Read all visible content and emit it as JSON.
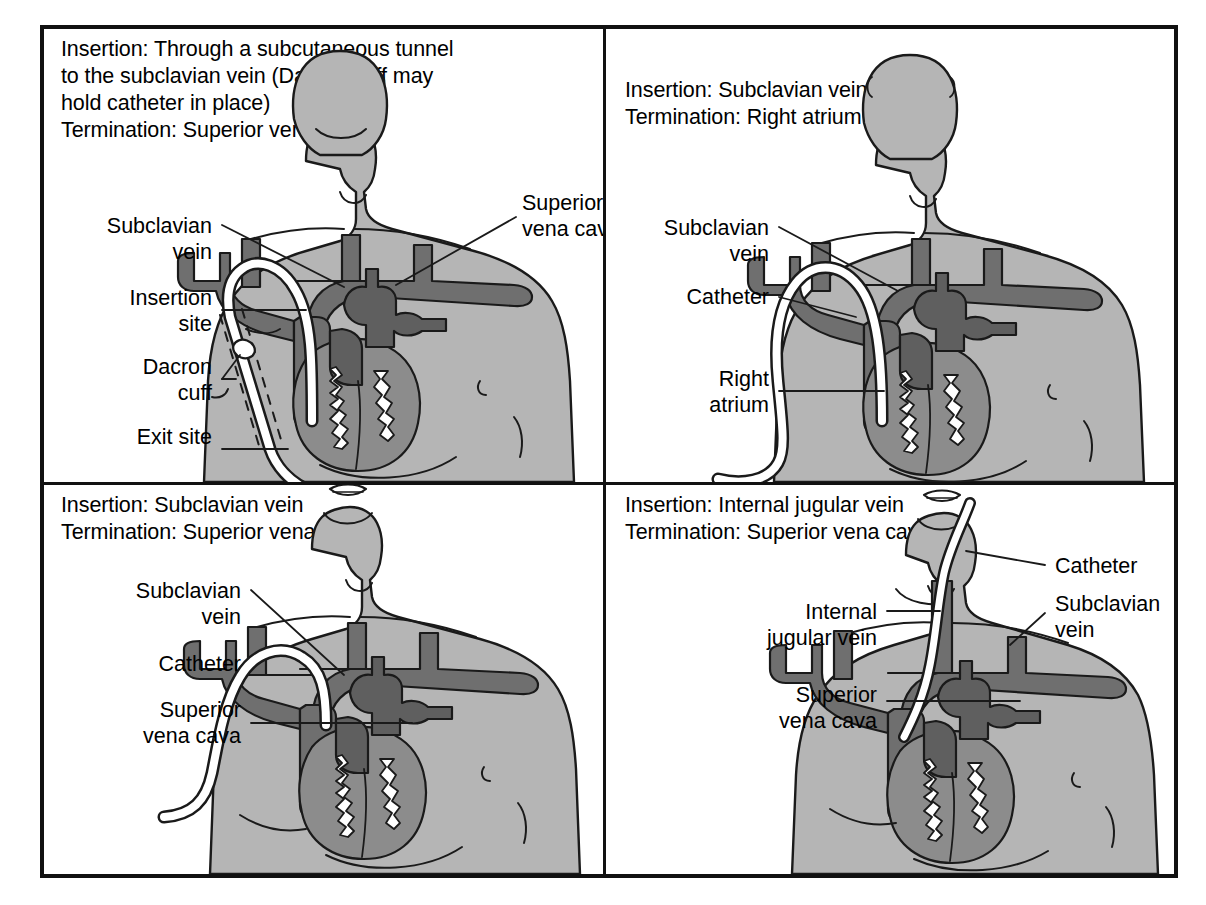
{
  "figure": {
    "colors": {
      "frame": "#111111",
      "skin": "#b5b5b5",
      "skin_shadow": "#a2a2a2",
      "vessel": "#6f6f6f",
      "heart": "#8c8c8c",
      "heart_dark": "#5f5f5f",
      "catheter_fill": "#ffffff",
      "outline": "#1a1a1a",
      "text": "#000000",
      "background": "#ffffff"
    },
    "panel_count": 4,
    "layout": "2x2 grid"
  },
  "panels": [
    {
      "id": "tunneled-subclavian-svc",
      "position": "top-left",
      "caption": "Insertion: Through a subcutaneous tunnel\nto the subclavian vein (Dacron cuff may\nhold catheter in place)\nTermination: Superior vena cava",
      "insertion": "Through a subcutaneous tunnel to the subclavian vein (Dacron cuff may hold catheter in place)",
      "termination": "Superior vena cava",
      "labels": [
        {
          "name": "subclavian-vein",
          "text": "Subclavian\nvein",
          "align": "right",
          "x": 168,
          "y": 196
        },
        {
          "name": "insertion-site",
          "text": "Insertion\nsite",
          "align": "right",
          "x": 168,
          "y": 268
        },
        {
          "name": "dacron-cuff",
          "text": "Dacron\ncuff",
          "align": "right",
          "x": 168,
          "y": 337
        },
        {
          "name": "exit-site",
          "text": "Exit site",
          "align": "right",
          "x": 168,
          "y": 407
        },
        {
          "name": "superior-vena-cava",
          "text": "Superior\nvena cava",
          "align": "left",
          "x": 478,
          "y": 173
        }
      ]
    },
    {
      "id": "subclavian-right-atrium",
      "position": "top-right",
      "caption": "Insertion: Subclavian vein\nTermination: Right atrium",
      "insertion": "Subclavian vein",
      "termination": "Right atrium",
      "labels": [
        {
          "name": "subclavian-vein",
          "text": "Subclavian\nvein",
          "align": "right",
          "x": 163,
          "y": 198
        },
        {
          "name": "catheter",
          "text": "Catheter",
          "align": "right",
          "x": 163,
          "y": 266
        },
        {
          "name": "right-atrium",
          "text": "Right\natrium",
          "align": "right",
          "x": 163,
          "y": 348
        }
      ]
    },
    {
      "id": "subclavian-svc",
      "position": "bottom-left",
      "caption": "Insertion: Subclavian vein\nTermination: Superior vena cava",
      "insertion": "Subclavian vein",
      "termination": "Superior vena cava",
      "labels": [
        {
          "name": "subclavian-vein",
          "text": "Subclavian\nvein",
          "align": "right",
          "x": 197,
          "y": 105
        },
        {
          "name": "catheter",
          "text": "Catheter",
          "align": "right",
          "x": 197,
          "y": 177
        },
        {
          "name": "superior-vena-cava",
          "text": "Superior\nvena cava",
          "align": "right",
          "x": 197,
          "y": 224
        }
      ]
    },
    {
      "id": "internal-jugular-svc",
      "position": "bottom-right",
      "caption": "Insertion: Internal jugular vein\nTermination: Superior vena cava",
      "insertion": "Internal jugular vein",
      "termination": "Superior vena cava",
      "labels": [
        {
          "name": "internal-jugular-vein",
          "text": "Internal\njugular vein",
          "align": "right",
          "x": 271,
          "y": 126
        },
        {
          "name": "superior-vena-cava",
          "text": "Superior\nvena cava",
          "align": "right",
          "x": 271,
          "y": 209
        },
        {
          "name": "catheter",
          "text": "Catheter",
          "align": "left",
          "x": 449,
          "y": 80
        },
        {
          "name": "subclavian-vein",
          "text": "Subclavian\nvein",
          "align": "left",
          "x": 449,
          "y": 118
        }
      ]
    }
  ]
}
